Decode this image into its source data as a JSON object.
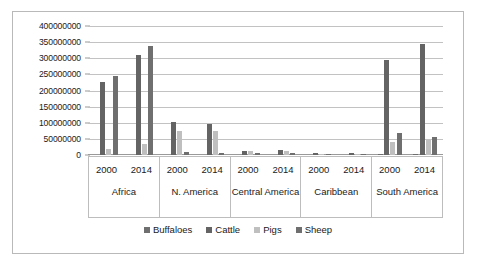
{
  "chart_data": {
    "type": "bar",
    "title": "",
    "subtitle": "",
    "xlabel": "",
    "ylabel": "",
    "ylim": [
      0,
      400000000
    ],
    "ytick_values": [
      0,
      50000000,
      100000000,
      150000000,
      200000000,
      250000000,
      300000000,
      350000000,
      400000000
    ],
    "ytick_labels": [
      "0",
      "50000000",
      "100000000",
      "150000000",
      "200000000",
      "250000000",
      "300000000",
      "350000000",
      "400000000"
    ],
    "grid": true,
    "legend_position": "bottom",
    "group_labels": [
      "Africa",
      "N. America",
      "Central America",
      "Caribbean",
      "South America"
    ],
    "year_labels": [
      "2000",
      "2014"
    ],
    "categories": [
      "Africa 2000",
      "Africa 2014",
      "N. America 2000",
      "N. America 2014",
      "Central America 2000",
      "Central America 2014",
      "Caribbean 2000",
      "Caribbean 2014",
      "South America 2000",
      "South America 2014"
    ],
    "series": [
      {
        "name": "Buffaloes",
        "color": "#6f6f6f",
        "values": [
          0,
          0,
          0,
          0,
          0,
          0,
          0,
          0,
          1000000,
          1200000
        ]
      },
      {
        "name": "Cattle",
        "color": "#646464",
        "values": [
          225000000,
          310000000,
          103000000,
          96000000,
          13000000,
          15000000,
          7500000,
          6500000,
          295000000,
          345000000
        ]
      },
      {
        "name": "Pigs",
        "color": "#bfbfbf",
        "values": [
          20000000,
          34000000,
          75000000,
          74000000,
          11000000,
          13000000,
          3000000,
          3500000,
          40000000,
          48000000
        ]
      },
      {
        "name": "Sheep",
        "color": "#6f6f6f",
        "values": [
          246000000,
          337000000,
          8000000,
          6500000,
          7000000,
          6000000,
          600000,
          600000,
          67000000,
          57000000
        ]
      }
    ]
  },
  "legend": {
    "items": [
      {
        "label": "Buffaloes",
        "color": "#6f6f6f"
      },
      {
        "label": "Cattle",
        "color": "#646464"
      },
      {
        "label": "Pigs",
        "color": "#bfbfbf"
      },
      {
        "label": "Sheep",
        "color": "#6f6f6f"
      }
    ]
  }
}
